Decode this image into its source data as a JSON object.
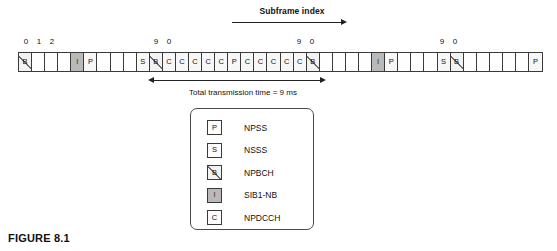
{
  "figure": {
    "caption": "FIGURE 8.1"
  },
  "header": {
    "subframe_index_label": "Subframe index",
    "arrow_icon": "arrow-right-icon"
  },
  "annotation": {
    "tx_time_label": "Total transmission time = 9 ms",
    "arrow_icon": "double-arrow-horizontal-icon"
  },
  "index_numbers": [
    {
      "text": "0",
      "left": 19
    },
    {
      "text": "1",
      "left": 32
    },
    {
      "text": "2",
      "left": 45
    },
    {
      "text": "9",
      "left": 149
    },
    {
      "text": "0",
      "left": 162
    },
    {
      "text": "9",
      "left": 292
    },
    {
      "text": "0",
      "left": 305
    },
    {
      "text": "9",
      "left": 435
    },
    {
      "text": "0",
      "left": 448
    }
  ],
  "timeline": {
    "cells": [
      {
        "label": "B",
        "type": "npbch"
      },
      {
        "label": "",
        "type": "empty"
      },
      {
        "label": "",
        "type": "empty"
      },
      {
        "label": "",
        "type": "empty"
      },
      {
        "label": "I",
        "type": "sib1"
      },
      {
        "label": "P",
        "type": "npss"
      },
      {
        "label": "",
        "type": "empty"
      },
      {
        "label": "",
        "type": "empty"
      },
      {
        "label": "",
        "type": "empty"
      },
      {
        "label": "S",
        "type": "nsss"
      },
      {
        "label": "B",
        "type": "npbch"
      },
      {
        "label": "C",
        "type": "npdcch"
      },
      {
        "label": "C",
        "type": "npdcch"
      },
      {
        "label": "C",
        "type": "npdcch"
      },
      {
        "label": "C",
        "type": "npdcch"
      },
      {
        "label": "C",
        "type": "npdcch"
      },
      {
        "label": "P",
        "type": "npss"
      },
      {
        "label": "C",
        "type": "npdcch"
      },
      {
        "label": "C",
        "type": "npdcch"
      },
      {
        "label": "C",
        "type": "npdcch"
      },
      {
        "label": "C",
        "type": "npdcch"
      },
      {
        "label": "C",
        "type": "npdcch"
      },
      {
        "label": "B",
        "type": "npbch"
      },
      {
        "label": "",
        "type": "empty"
      },
      {
        "label": "",
        "type": "empty"
      },
      {
        "label": "",
        "type": "empty"
      },
      {
        "label": "",
        "type": "empty"
      },
      {
        "label": "I",
        "type": "sib1"
      },
      {
        "label": "P",
        "type": "npss"
      },
      {
        "label": "",
        "type": "empty"
      },
      {
        "label": "",
        "type": "empty"
      },
      {
        "label": "",
        "type": "empty"
      },
      {
        "label": "S",
        "type": "nsss"
      },
      {
        "label": "B",
        "type": "npbch"
      },
      {
        "label": "",
        "type": "empty"
      },
      {
        "label": "",
        "type": "empty"
      },
      {
        "label": "",
        "type": "empty"
      },
      {
        "label": "",
        "type": "empty"
      },
      {
        "label": "",
        "type": "empty"
      },
      {
        "label": "P",
        "type": "npss"
      }
    ]
  },
  "legend": {
    "items": [
      {
        "symbol": "P",
        "name": "NPSS",
        "type": "npss"
      },
      {
        "symbol": "S",
        "name": "NSSS",
        "type": "nsss"
      },
      {
        "symbol": "B",
        "name": "NPBCH",
        "type": "npbch"
      },
      {
        "symbol": "I",
        "name": "SIB1-NB",
        "type": "sib1"
      },
      {
        "symbol": "C",
        "name": "NPDCCH",
        "type": "npdcch"
      }
    ]
  },
  "colors": {
    "outline": "#3a3a3a",
    "sib1_fill": "#b9b9b9",
    "hatch": "#6d6d6d",
    "text": "#111111"
  }
}
